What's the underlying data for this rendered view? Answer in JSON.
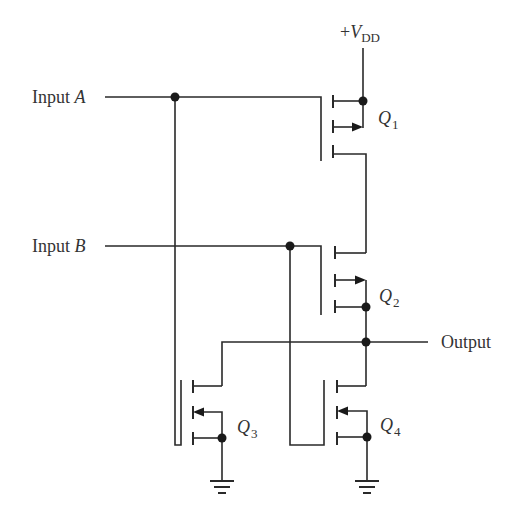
{
  "supply": {
    "prefix": "+",
    "symbol": "V",
    "subscript": "DD"
  },
  "inputs": [
    {
      "label": "Input",
      "name": "A"
    },
    {
      "label": "Input",
      "name": "B"
    }
  ],
  "output": {
    "label": "Output"
  },
  "transistors": [
    {
      "symbol": "Q",
      "index": "1"
    },
    {
      "symbol": "Q",
      "index": "2"
    },
    {
      "symbol": "Q",
      "index": "3"
    },
    {
      "symbol": "Q",
      "index": "4"
    }
  ]
}
